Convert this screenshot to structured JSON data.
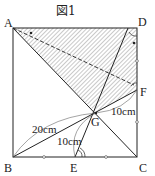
{
  "figure": {
    "title": "図1",
    "points": {
      "A": "A",
      "B": "B",
      "C": "C",
      "D": "D",
      "E": "E",
      "F": "F",
      "G": "G"
    },
    "lengths": {
      "BG": "20cm",
      "EG": "10cm",
      "GF": "10cm"
    }
  }
}
